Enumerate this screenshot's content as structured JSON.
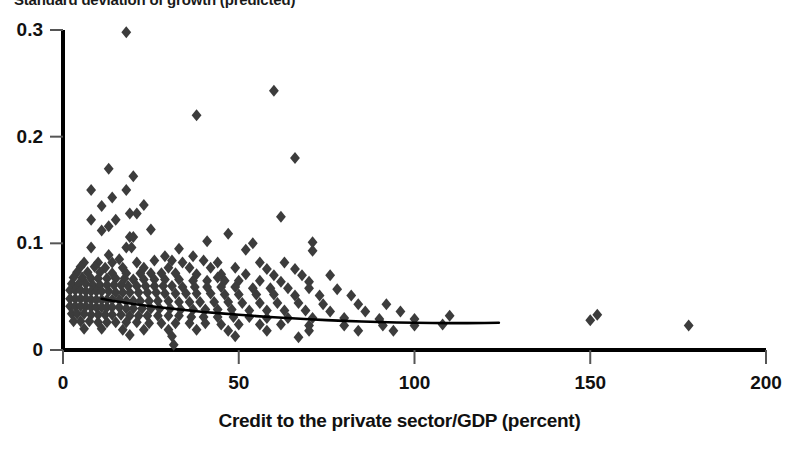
{
  "chart_data": {
    "type": "scatter",
    "title": "Standard deviation of growth (predicted)",
    "xlabel": "Credit to the private sector/GDP (percent)",
    "ylabel": "",
    "xlim": [
      0,
      200
    ],
    "ylim": [
      0,
      0.3
    ],
    "xticks": [
      0,
      50,
      100,
      150,
      200
    ],
    "yticks": [
      0,
      0.1,
      0.2,
      0.3
    ],
    "xtick_labels": [
      "0",
      "50",
      "100",
      "150",
      "200"
    ],
    "ytick_labels": [
      "0",
      "0.1",
      "0.2",
      "0.3"
    ],
    "grid": false,
    "legend": null,
    "marker": "diamond",
    "marker_color": "#3c3c3c",
    "marker_size": 6,
    "axis_color": "#000000",
    "trendline": {
      "name": "fitted trend",
      "color": "#000000",
      "width": 2.6,
      "points": [
        [
          11.0,
          0.048
        ],
        [
          14.0,
          0.0462
        ],
        [
          17.0,
          0.0447
        ],
        [
          20.0,
          0.0432
        ],
        [
          24.0,
          0.0415
        ],
        [
          28.0,
          0.0399
        ],
        [
          32.0,
          0.0384
        ],
        [
          36.0,
          0.037
        ],
        [
          40.0,
          0.0357
        ],
        [
          45.0,
          0.0343
        ],
        [
          50.0,
          0.033
        ],
        [
          55.0,
          0.0318
        ],
        [
          60.0,
          0.0307
        ],
        [
          65.0,
          0.0297
        ],
        [
          70.0,
          0.0288
        ],
        [
          75.0,
          0.028
        ],
        [
          80.0,
          0.0273
        ],
        [
          85.0,
          0.0267
        ],
        [
          90.0,
          0.0262
        ],
        [
          95.0,
          0.0258
        ],
        [
          100.0,
          0.0255
        ],
        [
          105.0,
          0.0253
        ],
        [
          110.0,
          0.0252
        ],
        [
          115.0,
          0.0252
        ],
        [
          120.0,
          0.0253
        ],
        [
          124.0,
          0.0255
        ]
      ]
    },
    "points": [
      [
        18.0,
        0.298
      ],
      [
        60.0,
        0.243
      ],
      [
        38.0,
        0.22
      ],
      [
        66.0,
        0.18
      ],
      [
        13.0,
        0.17
      ],
      [
        20.0,
        0.163
      ],
      [
        8.0,
        0.15
      ],
      [
        18.0,
        0.15
      ],
      [
        14.0,
        0.143
      ],
      [
        11.0,
        0.135
      ],
      [
        23.0,
        0.136
      ],
      [
        19.0,
        0.128
      ],
      [
        21.0,
        0.128
      ],
      [
        62.0,
        0.125
      ],
      [
        8.0,
        0.122
      ],
      [
        15.0,
        0.122
      ],
      [
        13.0,
        0.116
      ],
      [
        11.0,
        0.112
      ],
      [
        25.0,
        0.113
      ],
      [
        19.0,
        0.106
      ],
      [
        20.0,
        0.106
      ],
      [
        47.0,
        0.109
      ],
      [
        41.0,
        0.102
      ],
      [
        54.0,
        0.1
      ],
      [
        71.0,
        0.101
      ],
      [
        8.0,
        0.096
      ],
      [
        18.0,
        0.096
      ],
      [
        19.5,
        0.096
      ],
      [
        33.0,
        0.095
      ],
      [
        52.0,
        0.094
      ],
      [
        71.0,
        0.093
      ],
      [
        13.0,
        0.089
      ],
      [
        29.0,
        0.088
      ],
      [
        37.0,
        0.088
      ],
      [
        16.0,
        0.085
      ],
      [
        26.0,
        0.084
      ],
      [
        31.0,
        0.084
      ],
      [
        40.0,
        0.084
      ],
      [
        6.0,
        0.082
      ],
      [
        10.0,
        0.082
      ],
      [
        14.0,
        0.082
      ],
      [
        21.0,
        0.082
      ],
      [
        34.0,
        0.082
      ],
      [
        44.0,
        0.082
      ],
      [
        56.0,
        0.082
      ],
      [
        63.0,
        0.082
      ],
      [
        5.0,
        0.078
      ],
      [
        9.0,
        0.078
      ],
      [
        12.0,
        0.077
      ],
      [
        17.0,
        0.077
      ],
      [
        23.0,
        0.077
      ],
      [
        30.0,
        0.077
      ],
      [
        36.0,
        0.077
      ],
      [
        42.0,
        0.077
      ],
      [
        49.0,
        0.077
      ],
      [
        58.0,
        0.076
      ],
      [
        66.0,
        0.076
      ],
      [
        4.0,
        0.073
      ],
      [
        7.0,
        0.073
      ],
      [
        10.5,
        0.073
      ],
      [
        14.0,
        0.072
      ],
      [
        18.0,
        0.072
      ],
      [
        22.0,
        0.072
      ],
      [
        25.0,
        0.072
      ],
      [
        28.0,
        0.072
      ],
      [
        32.0,
        0.072
      ],
      [
        38.0,
        0.071
      ],
      [
        45.0,
        0.071
      ],
      [
        52.0,
        0.071
      ],
      [
        60.0,
        0.07
      ],
      [
        68.0,
        0.07
      ],
      [
        76.0,
        0.07
      ],
      [
        3.0,
        0.068
      ],
      [
        5.5,
        0.068
      ],
      [
        8.0,
        0.067
      ],
      [
        10.0,
        0.067
      ],
      [
        12.5,
        0.067
      ],
      [
        15.0,
        0.067
      ],
      [
        17.5,
        0.067
      ],
      [
        20.0,
        0.066
      ],
      [
        23.0,
        0.066
      ],
      [
        26.0,
        0.066
      ],
      [
        29.0,
        0.066
      ],
      [
        33.0,
        0.066
      ],
      [
        37.0,
        0.065
      ],
      [
        41.0,
        0.065
      ],
      [
        46.0,
        0.065
      ],
      [
        50.0,
        0.065
      ],
      [
        56.0,
        0.065
      ],
      [
        62.0,
        0.064
      ],
      [
        70.0,
        0.064
      ],
      [
        44.0,
        0.068
      ],
      [
        2.5,
        0.062
      ],
      [
        4.5,
        0.062
      ],
      [
        6.5,
        0.062
      ],
      [
        8.5,
        0.061
      ],
      [
        10.5,
        0.061
      ],
      [
        12.5,
        0.061
      ],
      [
        14.5,
        0.061
      ],
      [
        16.5,
        0.061
      ],
      [
        18.5,
        0.06
      ],
      [
        21.0,
        0.06
      ],
      [
        23.5,
        0.06
      ],
      [
        26.0,
        0.06
      ],
      [
        28.5,
        0.06
      ],
      [
        31.0,
        0.06
      ],
      [
        34.0,
        0.059
      ],
      [
        37.5,
        0.059
      ],
      [
        41.0,
        0.059
      ],
      [
        45.0,
        0.059
      ],
      [
        49.0,
        0.059
      ],
      [
        54.0,
        0.058
      ],
      [
        59.0,
        0.058
      ],
      [
        64.0,
        0.058
      ],
      [
        70.0,
        0.058
      ],
      [
        78.0,
        0.057
      ],
      [
        2.0,
        0.056
      ],
      [
        3.5,
        0.056
      ],
      [
        5.0,
        0.056
      ],
      [
        6.5,
        0.055
      ],
      [
        8.0,
        0.055
      ],
      [
        9.5,
        0.055
      ],
      [
        11.0,
        0.055
      ],
      [
        13.0,
        0.055
      ],
      [
        15.0,
        0.054
      ],
      [
        17.0,
        0.054
      ],
      [
        19.0,
        0.054
      ],
      [
        21.5,
        0.054
      ],
      [
        24.0,
        0.054
      ],
      [
        26.5,
        0.054
      ],
      [
        29.0,
        0.053
      ],
      [
        32.0,
        0.053
      ],
      [
        35.0,
        0.053
      ],
      [
        38.0,
        0.053
      ],
      [
        42.0,
        0.053
      ],
      [
        46.0,
        0.052
      ],
      [
        50.0,
        0.052
      ],
      [
        55.0,
        0.052
      ],
      [
        60.0,
        0.052
      ],
      [
        66.0,
        0.051
      ],
      [
        73.0,
        0.051
      ],
      [
        82.0,
        0.051
      ],
      [
        2.0,
        0.048
      ],
      [
        3.5,
        0.048
      ],
      [
        5.0,
        0.048
      ],
      [
        6.5,
        0.048
      ],
      [
        8.0,
        0.047
      ],
      [
        9.5,
        0.047
      ],
      [
        11.0,
        0.047
      ],
      [
        12.5,
        0.047
      ],
      [
        14.0,
        0.047
      ],
      [
        16.0,
        0.047
      ],
      [
        18.0,
        0.046
      ],
      [
        20.0,
        0.046
      ],
      [
        22.0,
        0.046
      ],
      [
        24.5,
        0.046
      ],
      [
        27.0,
        0.046
      ],
      [
        30.0,
        0.046
      ],
      [
        33.0,
        0.045
      ],
      [
        36.0,
        0.045
      ],
      [
        39.0,
        0.045
      ],
      [
        43.0,
        0.045
      ],
      [
        47.0,
        0.045
      ],
      [
        51.0,
        0.044
      ],
      [
        56.0,
        0.044
      ],
      [
        61.0,
        0.044
      ],
      [
        67.0,
        0.044
      ],
      [
        74.0,
        0.043
      ],
      [
        84.0,
        0.043
      ],
      [
        92.0,
        0.043
      ],
      [
        2.0,
        0.041
      ],
      [
        3.5,
        0.041
      ],
      [
        5.0,
        0.041
      ],
      [
        6.5,
        0.041
      ],
      [
        8.0,
        0.04
      ],
      [
        9.5,
        0.04
      ],
      [
        11.0,
        0.04
      ],
      [
        12.5,
        0.04
      ],
      [
        14.0,
        0.04
      ],
      [
        16.0,
        0.04
      ],
      [
        18.0,
        0.039
      ],
      [
        20.0,
        0.039
      ],
      [
        22.5,
        0.039
      ],
      [
        25.0,
        0.039
      ],
      [
        27.5,
        0.039
      ],
      [
        30.5,
        0.039
      ],
      [
        33.5,
        0.038
      ],
      [
        37.0,
        0.038
      ],
      [
        40.5,
        0.038
      ],
      [
        44.0,
        0.038
      ],
      [
        48.0,
        0.038
      ],
      [
        53.0,
        0.037
      ],
      [
        58.0,
        0.037
      ],
      [
        63.0,
        0.037
      ],
      [
        69.0,
        0.037
      ],
      [
        76.0,
        0.036
      ],
      [
        86.0,
        0.036
      ],
      [
        96.0,
        0.036
      ],
      [
        2.5,
        0.034
      ],
      [
        4.0,
        0.034
      ],
      [
        6.0,
        0.034
      ],
      [
        8.0,
        0.033
      ],
      [
        10.0,
        0.033
      ],
      [
        12.0,
        0.033
      ],
      [
        14.0,
        0.033
      ],
      [
        16.5,
        0.033
      ],
      [
        19.0,
        0.032
      ],
      [
        21.5,
        0.032
      ],
      [
        24.0,
        0.032
      ],
      [
        27.0,
        0.032
      ],
      [
        30.0,
        0.032
      ],
      [
        33.0,
        0.032
      ],
      [
        36.5,
        0.031
      ],
      [
        40.0,
        0.031
      ],
      [
        44.0,
        0.031
      ],
      [
        48.5,
        0.031
      ],
      [
        53.0,
        0.031
      ],
      [
        58.0,
        0.03
      ],
      [
        64.0,
        0.03
      ],
      [
        71.0,
        0.03
      ],
      [
        80.0,
        0.03
      ],
      [
        90.0,
        0.029
      ],
      [
        100.0,
        0.029
      ],
      [
        110.0,
        0.032
      ],
      [
        152.0,
        0.033
      ],
      [
        3.0,
        0.027
      ],
      [
        5.0,
        0.027
      ],
      [
        7.5,
        0.027
      ],
      [
        10.0,
        0.026
      ],
      [
        12.5,
        0.026
      ],
      [
        15.0,
        0.026
      ],
      [
        18.0,
        0.026
      ],
      [
        21.0,
        0.026
      ],
      [
        24.5,
        0.025
      ],
      [
        28.0,
        0.025
      ],
      [
        32.0,
        0.025
      ],
      [
        36.0,
        0.025
      ],
      [
        40.5,
        0.025
      ],
      [
        45.0,
        0.024
      ],
      [
        50.0,
        0.024
      ],
      [
        56.0,
        0.024
      ],
      [
        62.0,
        0.024
      ],
      [
        70.0,
        0.023
      ],
      [
        80.0,
        0.023
      ],
      [
        91.0,
        0.023
      ],
      [
        100.0,
        0.023
      ],
      [
        108.0,
        0.024
      ],
      [
        150.0,
        0.028
      ],
      [
        178.0,
        0.023
      ],
      [
        6.0,
        0.02
      ],
      [
        11.0,
        0.02
      ],
      [
        17.0,
        0.019
      ],
      [
        23.0,
        0.019
      ],
      [
        30.0,
        0.019
      ],
      [
        38.0,
        0.019
      ],
      [
        47.0,
        0.018
      ],
      [
        58.0,
        0.018
      ],
      [
        70.0,
        0.018
      ],
      [
        84.0,
        0.018
      ],
      [
        94.0,
        0.018
      ],
      [
        19.0,
        0.014
      ],
      [
        31.0,
        0.013
      ],
      [
        49.0,
        0.013
      ],
      [
        67.0,
        0.012
      ],
      [
        31.5,
        0.005
      ]
    ]
  }
}
